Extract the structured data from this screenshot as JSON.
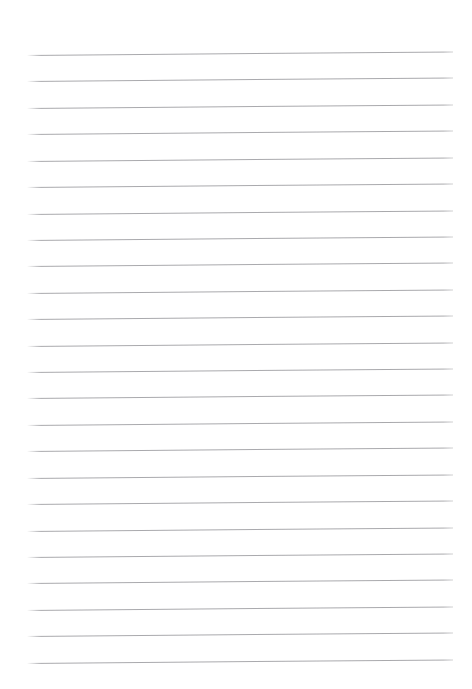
{
  "document": {
    "kind": "ruled-paper-sheet",
    "description": "Blank lined notebook page",
    "page_width": 472,
    "page_height": 689,
    "page_background": "#ffffff",
    "has_text_content": false,
    "has_margin_rule": false,
    "has_page_border": false,
    "has_holes": false,
    "has_header": false,
    "has_footer": false,
    "body_text": ""
  },
  "ruling": {
    "line_count": 24,
    "line_color": "#a2a2a6",
    "line_thickness_px": 1,
    "line_style": "solid",
    "left_x": 27,
    "right_x": 453,
    "line_length_px": 426,
    "first_line_y": 55,
    "last_line_y": 663,
    "line_spacing_px": 26.4,
    "skew_degrees": -0.48,
    "top_margin_px": 55,
    "bottom_margin_px": 26,
    "left_margin_px": 27,
    "right_margin_px": 19,
    "lines": [
      {
        "index": 1,
        "y": 55.0,
        "text": ""
      },
      {
        "index": 2,
        "y": 81.4,
        "text": ""
      },
      {
        "index": 3,
        "y": 107.8,
        "text": ""
      },
      {
        "index": 4,
        "y": 134.2,
        "text": ""
      },
      {
        "index": 5,
        "y": 160.7,
        "text": ""
      },
      {
        "index": 6,
        "y": 187.1,
        "text": ""
      },
      {
        "index": 7,
        "y": 213.5,
        "text": ""
      },
      {
        "index": 8,
        "y": 239.9,
        "text": ""
      },
      {
        "index": 9,
        "y": 266.3,
        "text": ""
      },
      {
        "index": 10,
        "y": 292.7,
        "text": ""
      },
      {
        "index": 11,
        "y": 319.1,
        "text": ""
      },
      {
        "index": 12,
        "y": 345.6,
        "text": ""
      },
      {
        "index": 13,
        "y": 372.0,
        "text": ""
      },
      {
        "index": 14,
        "y": 398.4,
        "text": ""
      },
      {
        "index": 15,
        "y": 424.8,
        "text": ""
      },
      {
        "index": 16,
        "y": 451.2,
        "text": ""
      },
      {
        "index": 17,
        "y": 477.6,
        "text": ""
      },
      {
        "index": 18,
        "y": 504.0,
        "text": ""
      },
      {
        "index": 19,
        "y": 530.5,
        "text": ""
      },
      {
        "index": 20,
        "y": 556.9,
        "text": ""
      },
      {
        "index": 21,
        "y": 583.3,
        "text": ""
      },
      {
        "index": 22,
        "y": 609.7,
        "text": ""
      },
      {
        "index": 23,
        "y": 636.1,
        "text": ""
      },
      {
        "index": 24,
        "y": 662.5,
        "text": ""
      }
    ]
  }
}
